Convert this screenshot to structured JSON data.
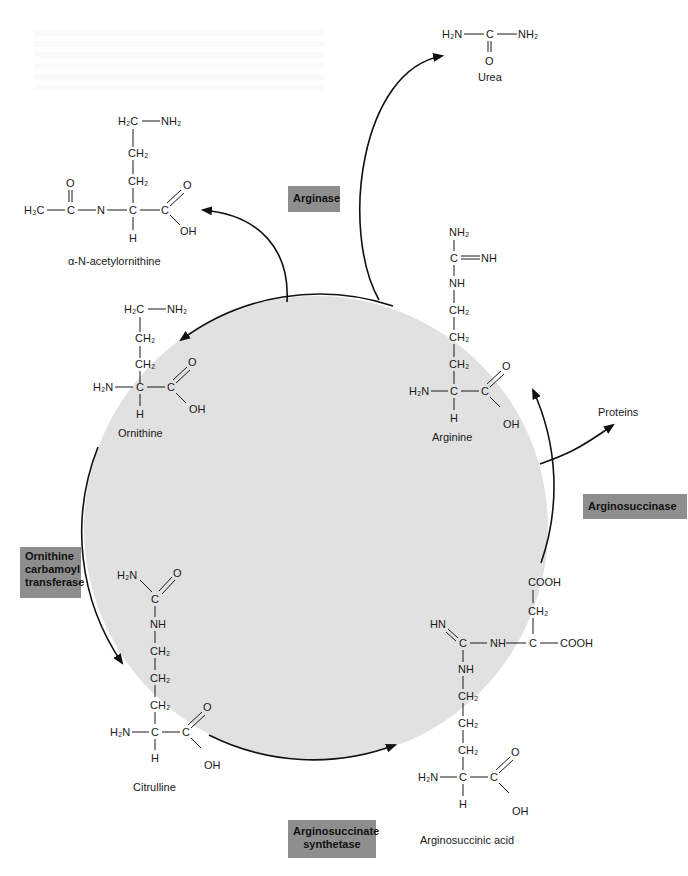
{
  "figure": {
    "colors": {
      "cycle_fill": "#e1e1e1",
      "enzyme_box": "#8e8e8e",
      "line": "#111111",
      "background": "#ffffff"
    }
  },
  "enzymes": {
    "arginase": "Arginase",
    "arginosuccinase": "Arginosuccinase",
    "ornithine_carbamoyl_transferase": [
      "Ornithine",
      "carbamoyl",
      "transferase"
    ],
    "arginosuccinate_synthetase": [
      "Arginosuccinate",
      "synthetase"
    ]
  },
  "molecules": {
    "urea": {
      "name": "Urea",
      "atoms": {
        "left": "H₂N",
        "center": "C",
        "right": "NH₂",
        "bottom": "O"
      }
    },
    "acetylornithine": {
      "name": "α-N-acetylornithine",
      "atoms": {
        "top": "H₂C",
        "top_right": "NH₂",
        "ch2a": "CH₂",
        "ch2b": "CH₂",
        "methyl": "H₃C",
        "carbonyl_c": "C",
        "carbonyl_o": "O",
        "n": "N",
        "alpha_c": "C",
        "h": "H",
        "acid_c": "C",
        "acid_o": "O",
        "oh": "OH"
      }
    },
    "ornithine": {
      "name": "Ornithine",
      "atoms": {
        "top": "H₂C",
        "top_right": "NH₂",
        "ch2a": "CH₂",
        "ch2b": "CH₂",
        "amine": "H₂N",
        "alpha_c": "C",
        "h": "H",
        "acid_c": "C",
        "acid_o": "O",
        "oh": "OH"
      }
    },
    "arginine": {
      "name": "Arginine",
      "atoms": {
        "nh2": "NH₂",
        "guan_c": "C",
        "imine": "NH",
        "nh": "NH",
        "ch2a": "CH₂",
        "ch2b": "CH₂",
        "ch2c": "CH₂",
        "amine": "H₂N",
        "alpha_c": "C",
        "h": "H",
        "acid_c": "C",
        "acid_o": "O",
        "oh": "OH"
      }
    },
    "citrulline": {
      "name": "Citrulline",
      "atoms": {
        "h2n_top": "H₂N",
        "o_top": "O",
        "carb_c": "C",
        "nh": "NH",
        "ch2a": "CH₂",
        "ch2b": "CH₂",
        "ch2c": "CH₂",
        "amine": "H₂N",
        "alpha_c": "C",
        "h": "H",
        "acid_c": "C",
        "acid_o": "O",
        "oh": "OH"
      }
    },
    "arginosuccinic_acid": {
      "name": "Arginosuccinic acid",
      "atoms": {
        "cooh_top": "COOH",
        "ch2_top": "CH₂",
        "hn": "HN",
        "guan_c": "C",
        "nh_link": "NH",
        "succ_c": "C",
        "cooh_right": "COOH",
        "nh": "NH",
        "ch2a": "CH₂",
        "ch2b": "CH₂",
        "ch2c": "CH₂",
        "amine": "H₂N",
        "alpha_c": "C",
        "h": "H",
        "acid_c": "C",
        "acid_o": "O",
        "oh": "OH"
      }
    }
  },
  "side_products": {
    "proteins": "Proteins"
  }
}
